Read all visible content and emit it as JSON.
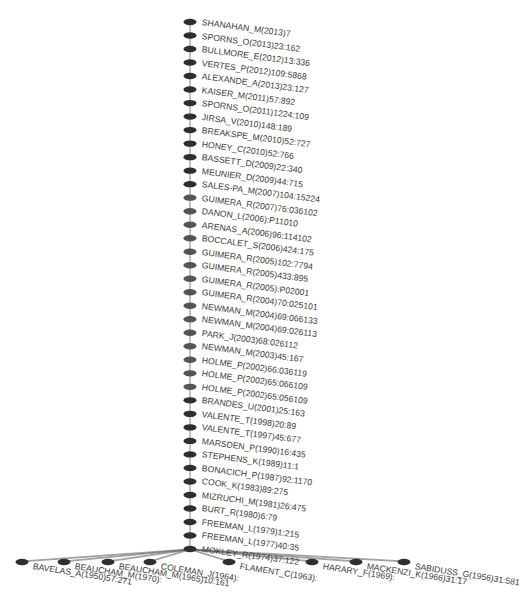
{
  "diagram": {
    "type": "citation-tree",
    "colors": {
      "node_dark": "#2f2f2f",
      "node_mid": "#555555",
      "edge": "#666666",
      "label": "#3a3a3a"
    },
    "chain_nodes": [
      {
        "label": "SHANAHAN_M(2013)7",
        "shade": "dark"
      },
      {
        "label": "SPORNS_O(2013)23:162",
        "shade": "dark"
      },
      {
        "label": "BULLMORE_E(2012)13:336",
        "shade": "dark"
      },
      {
        "label": "VERTES_P(2012)109:5868",
        "shade": "dark"
      },
      {
        "label": "ALEXANDE_A(2013)23:127",
        "shade": "dark"
      },
      {
        "label": "KAISER_M(2011)57:892",
        "shade": "dark"
      },
      {
        "label": "SPORNS_O(2011)1224:109",
        "shade": "dark"
      },
      {
        "label": "JIRSA_V(2010)148:189",
        "shade": "dark"
      },
      {
        "label": "BREAKSPE_M(2010)52:727",
        "shade": "dark"
      },
      {
        "label": "HONEY_C(2010)52:766",
        "shade": "dark"
      },
      {
        "label": "BASSETT_D(2009)22:340",
        "shade": "dark"
      },
      {
        "label": "MEUNIER_D(2009)44:715",
        "shade": "dark"
      },
      {
        "label": "SALES-PA_M(2007)104:15224",
        "shade": "dark"
      },
      {
        "label": "GUIMERA_R(2007)76:036102",
        "shade": "mid"
      },
      {
        "label": "DANON_L(2006):P11010",
        "shade": "mid"
      },
      {
        "label": "ARENAS_A(2006)96:114102",
        "shade": "mid"
      },
      {
        "label": "BOCCALET_S(2006)424:175",
        "shade": "mid"
      },
      {
        "label": "GUIMERA_R(2005)102:7794",
        "shade": "mid"
      },
      {
        "label": "GUIMERA_R(2005)433:895",
        "shade": "mid"
      },
      {
        "label": "GUIMERA_R(2005):P02001",
        "shade": "mid"
      },
      {
        "label": "GUIMERA_R(2004)70:025101",
        "shade": "mid"
      },
      {
        "label": "NEWMAN_M(2004)69:066133",
        "shade": "mid"
      },
      {
        "label": "NEWMAN_M(2004)69:026113",
        "shade": "mid"
      },
      {
        "label": "PARK_J(2003)68:026112",
        "shade": "mid"
      },
      {
        "label": "NEWMAN_M(2003)45:167",
        "shade": "mid"
      },
      {
        "label": "HOLME_P(2002)66:036119",
        "shade": "mid"
      },
      {
        "label": "HOLME_P(2002)65:066109",
        "shade": "mid"
      },
      {
        "label": "HOLME_P(2002)65:056109",
        "shade": "mid"
      },
      {
        "label": "BRANDES_U(2001)25:163",
        "shade": "dark"
      },
      {
        "label": "VALENTE_T(1998)20:89",
        "shade": "dark"
      },
      {
        "label": "VALENTE_T(1997)45:677",
        "shade": "dark"
      },
      {
        "label": "MARSDEN_P(1990)16:435",
        "shade": "dark"
      },
      {
        "label": "STEPHENS_K(1989)11:1",
        "shade": "dark"
      },
      {
        "label": "BONACICH_P(1987)92:1170",
        "shade": "dark"
      },
      {
        "label": "COOK_K(1983)89:275",
        "shade": "dark"
      },
      {
        "label": "MIZRUCHI_M(1981)26:475",
        "shade": "dark"
      },
      {
        "label": "BURT_R(1980)6:79",
        "shade": "dark"
      },
      {
        "label": "FREEMAN_L(1979)1:215",
        "shade": "dark"
      },
      {
        "label": "FREEMAN_L(1977)40:35",
        "shade": "dark"
      },
      {
        "label": "MOKLEY_R(1974)37:122",
        "shade": "dark"
      }
    ],
    "leaf_nodes": [
      {
        "label": "BAVELAS_A(1950)57:271",
        "x": 22,
        "y": 562
      },
      {
        "label": "BEAUCHAM_M(1970):",
        "x": 64,
        "y": 562
      },
      {
        "label": "BEAUCHAM_M(1965)10:161",
        "x": 108,
        "y": 562
      },
      {
        "label": "COLEMAN_J(1964):",
        "x": 150,
        "y": 562
      },
      {
        "label": "FLAMENT_C(1963):",
        "x": 229,
        "y": 562
      },
      {
        "label": "HARARY_F(1969):",
        "x": 312,
        "y": 562
      },
      {
        "label": "MACKENZI_K(1966)31:17",
        "x": 356,
        "y": 562
      },
      {
        "label": "SABIDUSS_G(1956)31:581",
        "x": 404,
        "y": 562
      }
    ]
  }
}
